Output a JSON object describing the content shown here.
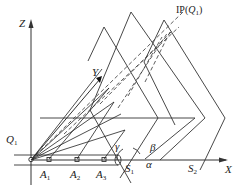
{
  "diagram": {
    "type": "3d-geometry-schematic",
    "axes": {
      "z_label": "Z",
      "x_label": "X",
      "y_label": "Y"
    },
    "points": {
      "q1": {
        "base": "Q",
        "sub": "1"
      },
      "a1": {
        "base": "A",
        "sub": "1"
      },
      "a2": {
        "base": "A",
        "sub": "2"
      },
      "a3": {
        "base": "A",
        "sub": "3"
      },
      "s1": {
        "base": "S",
        "sub": "1"
      },
      "s2": {
        "base": "S",
        "sub": "2"
      }
    },
    "angles": {
      "alpha": "α",
      "beta": "β",
      "gamma": "γ"
    },
    "ip_label": {
      "prefix": "IP(",
      "base": "Q",
      "sub": "1",
      "suffix": ")"
    },
    "colors": {
      "line": "#333333",
      "background": "#ffffff"
    }
  }
}
